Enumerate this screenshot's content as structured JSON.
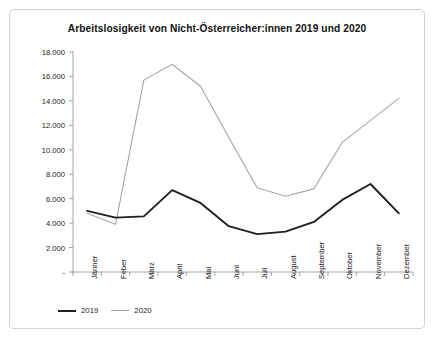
{
  "chart_data": {
    "type": "line",
    "title": "Arbeitslosigkeit von Nicht-Österreicher:innen 2019 und 2020",
    "xlabel": "",
    "ylabel": "",
    "categories": [
      "Jänner",
      "Feber",
      "März",
      "April",
      "Mai",
      "Juni",
      "Juli",
      "August",
      "September",
      "Oktober",
      "November",
      "Dezember"
    ],
    "series": [
      {
        "name": "2019",
        "color": "#1f1f1f",
        "values": [
          5000,
          4450,
          4550,
          6700,
          5650,
          3750,
          3100,
          3300,
          4100,
          5900,
          7200,
          4800
        ]
      },
      {
        "name": "2020",
        "color": "#a6a6a6",
        "values": [
          4800,
          3900,
          15700,
          17000,
          15200,
          11000,
          6900,
          6200,
          6800,
          10600,
          12400,
          14200
        ]
      }
    ],
    "ylim": [
      0,
      18000
    ],
    "yticks": [
      0,
      2000,
      4000,
      6000,
      8000,
      10000,
      12000,
      14000,
      16000,
      18000
    ],
    "ytick_labels": [
      "-",
      "2.000",
      "4.000",
      "6.000",
      "8.000",
      "10.000",
      "12.000",
      "14.000",
      "16.000",
      "18.000"
    ],
    "grid": false,
    "legend_position": "bottom-left"
  },
  "legend": {
    "items": [
      {
        "label": "2019",
        "color": "#1f1f1f"
      },
      {
        "label": "2020",
        "color": "#a6a6a6"
      }
    ]
  }
}
